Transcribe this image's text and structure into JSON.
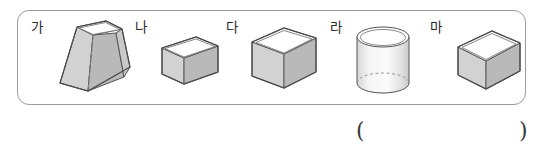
{
  "worksheet": {
    "panel_border_color": "#9a9a9a",
    "background_color": "#ffffff"
  },
  "solids": [
    {
      "label": "가",
      "name": "square-frustum",
      "shape_type": "truncated square pyramid",
      "open_top": true,
      "hidden_edges": "dashed",
      "fill_light": "#f2f2f2",
      "fill_mid": "#d9d9d9",
      "fill_dark": "#bdbdbd",
      "stroke": "#555555"
    },
    {
      "label": "나",
      "name": "rectangular-box-small",
      "shape_type": "cuboid",
      "open_top": true,
      "hidden_edges": "dashed",
      "fill_light": "#f2f2f2",
      "fill_mid": "#d9d9d9",
      "fill_dark": "#bdbdbd",
      "stroke": "#555555"
    },
    {
      "label": "다",
      "name": "cube",
      "shape_type": "cube",
      "open_top": true,
      "hidden_edges": "dashed",
      "fill_light": "#f2f2f2",
      "fill_mid": "#d9d9d9",
      "fill_dark": "#bdbdbd",
      "stroke": "#555555"
    },
    {
      "label": "라",
      "name": "cylinder",
      "shape_type": "cylinder",
      "open_top": true,
      "hidden_edges": "dashed",
      "fill_light": "#f7f7f7",
      "fill_mid": "#e4e4e4",
      "fill_dark": "#cfcfcf",
      "stroke": "#555555"
    },
    {
      "label": "마",
      "name": "rectangular-box-wide",
      "shape_type": "cuboid",
      "open_top": true,
      "hidden_edges": "dashed",
      "fill_light": "#f2f2f2",
      "fill_mid": "#d9d9d9",
      "fill_dark": "#bdbdbd",
      "stroke": "#555555"
    }
  ],
  "answer": {
    "open_paren": "(",
    "close_paren": ")",
    "value": ""
  }
}
